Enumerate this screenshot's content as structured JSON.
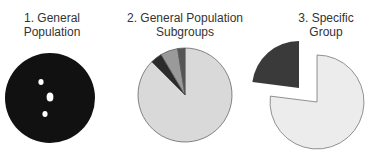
{
  "chart_data": [
    {
      "type": "pie",
      "title": "1. General Population",
      "title_lines": [
        "1. General",
        "Population"
      ],
      "slices": [
        {
          "label": "population",
          "value": 100,
          "color": "#111111"
        }
      ],
      "markers": [
        {
          "cx": 41,
          "cy": 82,
          "rx": 2.6,
          "ry": 3,
          "color": "#ffffff"
        },
        {
          "cx": 50,
          "cy": 97,
          "rx": 3.4,
          "ry": 4.5,
          "color": "#ffffff"
        },
        {
          "cx": 45,
          "cy": 114,
          "rx": 2.6,
          "ry": 3,
          "color": "#ffffff"
        }
      ]
    },
    {
      "type": "pie",
      "title": "2. General Population Subgroups",
      "title_lines": [
        "2. General Population",
        "Subgroups"
      ],
      "slices": [
        {
          "label": "subgroup-a",
          "value": 87.5,
          "color": "#d9d9d9"
        },
        {
          "label": "subgroup-b",
          "value": 4.0,
          "color": "#2b2b2b"
        },
        {
          "label": "subgroup-c",
          "value": 6.0,
          "color": "#9a9a9a"
        },
        {
          "label": "subgroup-d",
          "value": 2.5,
          "color": "#555555"
        }
      ]
    },
    {
      "type": "pie",
      "title": "3. Specific Group",
      "title_lines": [
        "3. Specific",
        "Group"
      ],
      "slices": [
        {
          "label": "rest",
          "value": 77,
          "color": "#ececec"
        },
        {
          "label": "specific-group",
          "value": 23,
          "color": "#3a3a3a",
          "exploded": true
        }
      ]
    }
  ],
  "titles": {
    "chart1": "1. General\nPopulation",
    "chart2": "2. General Population\nSubgroups",
    "chart3": "3. Specific\nGroup"
  }
}
